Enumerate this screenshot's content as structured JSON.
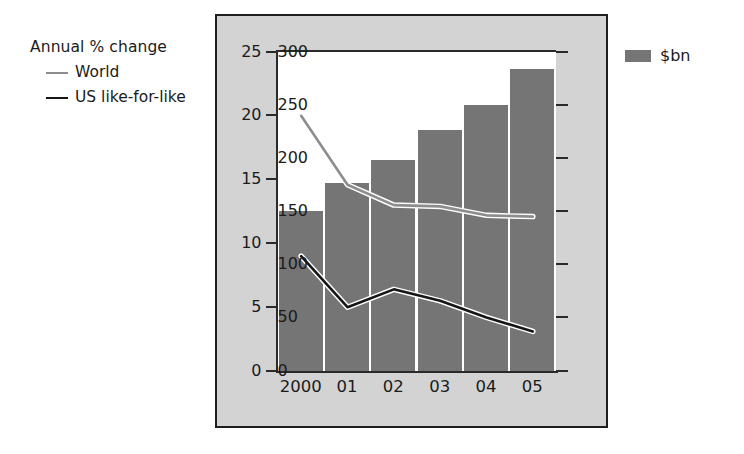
{
  "legend_left": {
    "title": "Annual % change",
    "items": [
      {
        "label": "World",
        "color": "#8d8d8d",
        "marker": "line-swatch-gray"
      },
      {
        "label": "US like-for-like",
        "color": "#161616",
        "marker": "line-swatch-black"
      }
    ]
  },
  "legend_right": {
    "label": "$bn",
    "color": "#757575",
    "marker": "bar-swatch-gray"
  },
  "chart_data": {
    "type": "bar",
    "title": "",
    "subtitle": "",
    "xlabel": "",
    "ylabel": "Annual % change",
    "y2label": "$bn",
    "categories": [
      "2000",
      "01",
      "02",
      "03",
      "04",
      "05"
    ],
    "ylim": [
      0,
      25
    ],
    "yticks": [
      0,
      5,
      10,
      15,
      20,
      25
    ],
    "y2lim": [
      0,
      300
    ],
    "y2ticks": [
      0,
      50,
      100,
      150,
      200,
      250,
      300
    ],
    "grid": false,
    "legend_position": "outside-left-and-right",
    "series": [
      {
        "name": "$bn",
        "type": "bar",
        "axis": "right",
        "color": "#757575",
        "values": [
          150,
          176,
          198,
          226,
          250,
          284
        ]
      },
      {
        "name": "World",
        "type": "line",
        "axis": "left",
        "color": "#8d8d8d",
        "values": [
          20.0,
          14.6,
          13.0,
          12.9,
          12.2,
          12.1
        ]
      },
      {
        "name": "US like-for-like",
        "type": "line",
        "axis": "left",
        "color": "#161616",
        "values": [
          9.0,
          5.0,
          6.4,
          5.5,
          4.2,
          3.1
        ]
      }
    ]
  },
  "colors": {
    "panel_background": "#d3d3d3",
    "plot_background": "#ffffff",
    "panel_border": "#1e1e1e",
    "bar": "#757575",
    "world_line": "#8d8d8d",
    "us_line": "#161616",
    "text": "#1b1b1b"
  }
}
